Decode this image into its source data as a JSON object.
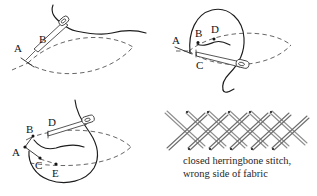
{
  "figure": {
    "panels": [
      {
        "id": "panel-1",
        "step": "1",
        "labels": [
          {
            "letter": "A",
            "x": 16,
            "y": 49
          },
          {
            "letter": "B",
            "x": 42,
            "y": 41
          }
        ],
        "description": "needle emerging at A, entering fabric at B"
      },
      {
        "id": "panel-2",
        "step": "2",
        "labels": [
          {
            "letter": "A",
            "x": 176,
            "y": 44
          },
          {
            "letter": "B",
            "x": 199,
            "y": 35
          },
          {
            "letter": "D",
            "x": 214,
            "y": 31
          },
          {
            "letter": "C",
            "x": 199,
            "y": 63
          }
        ],
        "description": "needle passing from D to C under the fabric"
      },
      {
        "id": "panel-3",
        "step": "3",
        "labels": [
          {
            "letter": "A",
            "x": 15,
            "y": 154
          },
          {
            "letter": "B",
            "x": 29,
            "y": 131
          },
          {
            "letter": "C",
            "x": 38,
            "y": 166
          },
          {
            "letter": "D",
            "x": 51,
            "y": 124
          },
          {
            "letter": "E",
            "x": 55,
            "y": 173
          }
        ],
        "description": "needle emerging at D for the next crossing stitch"
      },
      {
        "id": "panel-4",
        "step": "4",
        "description": "finished stitch pattern, lattice of crossed threads"
      }
    ],
    "caption": {
      "line1": "closed herringbone stitch,",
      "line2": "wrong side of fabric"
    },
    "colors": {
      "ink": "#262626",
      "dashed_fabric": "#4a4a4a",
      "thread": "#1c1c1c",
      "stitch_gray": "#8f8f8f",
      "background": "#ffffff"
    }
  }
}
